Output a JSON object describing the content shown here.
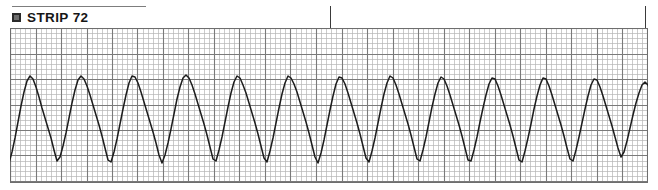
{
  "strip": {
    "bullet_icon": "filled-square-bullet-icon",
    "label": "STRIP 72",
    "rule_visible": true
  },
  "grid": {
    "small_square_px": 5.1,
    "bold_every_n_small": 5,
    "fine_line_color": "#b4b4b4",
    "bold_line_color": "#7a7a7a",
    "border_color": "#6e6e6e",
    "background": "#ffffff",
    "origin_x": 10,
    "origin_y": 28,
    "width": 638,
    "height": 155
  },
  "ticks": [
    {
      "name": "event-tick-1",
      "x": 330,
      "y_top": 6,
      "height": 22,
      "color": "#3a3a3a"
    },
    {
      "name": "event-tick-2",
      "x": 645,
      "y_top": 6,
      "height": 22,
      "color": "#3a3a3a"
    }
  ],
  "trace": {
    "name": "ecg-waveform-trace",
    "color": "#1c1c1c",
    "stroke_width": 1.5,
    "rhythm": "wide-complex tachycardia",
    "complex_count": 26,
    "cycle_px": 31.8,
    "first_peak_x": 30,
    "baseline_y": 120,
    "peak_y": 75,
    "trough_y": 163
  },
  "chart_data": {
    "type": "line",
    "title": "STRIP 72",
    "xlabel": "",
    "ylabel": "",
    "grid": true,
    "legend": "none",
    "series": [
      {
        "name": "ECG lead",
        "points": [
          [
            0,
            131
          ],
          [
            3,
            142
          ],
          [
            6,
            155
          ],
          [
            9,
            163
          ],
          [
            12,
            152
          ],
          [
            15,
            138
          ],
          [
            18,
            122
          ],
          [
            21,
            106
          ],
          [
            24,
            92
          ],
          [
            27,
            81
          ],
          [
            30,
            76
          ],
          [
            33,
            79
          ],
          [
            36,
            87
          ],
          [
            39,
            97
          ],
          [
            42,
            108
          ],
          [
            45,
            118
          ],
          [
            48,
            128
          ],
          [
            51,
            138
          ],
          [
            54,
            150
          ],
          [
            57,
            161
          ],
          [
            60,
            157
          ],
          [
            63,
            146
          ],
          [
            66,
            133
          ],
          [
            69,
            118
          ],
          [
            72,
            103
          ],
          [
            75,
            90
          ],
          [
            78,
            80
          ],
          [
            81,
            76
          ],
          [
            84,
            79
          ],
          [
            87,
            86
          ],
          [
            90,
            95
          ],
          [
            93,
            105
          ],
          [
            96,
            115
          ],
          [
            99,
            125
          ],
          [
            102,
            136
          ],
          [
            105,
            148
          ],
          [
            108,
            160
          ],
          [
            111,
            162
          ],
          [
            114,
            152
          ],
          [
            117,
            139
          ],
          [
            120,
            124
          ],
          [
            123,
            109
          ],
          [
            126,
            95
          ],
          [
            129,
            83
          ],
          [
            132,
            76
          ],
          [
            135,
            77
          ],
          [
            138,
            83
          ],
          [
            141,
            92
          ],
          [
            144,
            102
          ],
          [
            147,
            112
          ],
          [
            150,
            122
          ],
          [
            153,
            132
          ],
          [
            156,
            143
          ],
          [
            159,
            155
          ],
          [
            162,
            163
          ],
          [
            165,
            155
          ],
          [
            168,
            143
          ],
          [
            171,
            129
          ],
          [
            174,
            114
          ],
          [
            177,
            99
          ],
          [
            180,
            87
          ],
          [
            183,
            78
          ],
          [
            186,
            75
          ],
          [
            189,
            78
          ],
          [
            192,
            85
          ],
          [
            195,
            94
          ],
          [
            198,
            104
          ],
          [
            201,
            114
          ],
          [
            204,
            124
          ],
          [
            207,
            135
          ],
          [
            210,
            147
          ],
          [
            213,
            159
          ],
          [
            216,
            161
          ],
          [
            219,
            150
          ],
          [
            222,
            137
          ],
          [
            225,
            122
          ],
          [
            228,
            107
          ],
          [
            231,
            93
          ],
          [
            234,
            82
          ],
          [
            237,
            76
          ],
          [
            240,
            78
          ],
          [
            243,
            85
          ],
          [
            246,
            93
          ],
          [
            249,
            103
          ],
          [
            252,
            113
          ],
          [
            255,
            123
          ],
          [
            258,
            134
          ],
          [
            261,
            146
          ],
          [
            264,
            158
          ],
          [
            267,
            162
          ],
          [
            270,
            151
          ],
          [
            273,
            138
          ],
          [
            276,
            123
          ],
          [
            279,
            108
          ],
          [
            282,
            94
          ],
          [
            285,
            83
          ],
          [
            288,
            76
          ],
          [
            291,
            78
          ],
          [
            294,
            84
          ],
          [
            297,
            92
          ],
          [
            300,
            102
          ],
          [
            303,
            112
          ],
          [
            306,
            122
          ],
          [
            309,
            133
          ],
          [
            312,
            145
          ],
          [
            315,
            157
          ],
          [
            318,
            163
          ],
          [
            321,
            153
          ],
          [
            324,
            140
          ],
          [
            327,
            125
          ],
          [
            330,
            110
          ],
          [
            333,
            96
          ],
          [
            336,
            84
          ],
          [
            339,
            77
          ],
          [
            342,
            78
          ],
          [
            345,
            84
          ],
          [
            348,
            93
          ],
          [
            351,
            103
          ],
          [
            354,
            113
          ],
          [
            357,
            123
          ],
          [
            360,
            134
          ],
          [
            363,
            146
          ],
          [
            366,
            158
          ],
          [
            369,
            162
          ],
          [
            372,
            151
          ],
          [
            375,
            138
          ],
          [
            378,
            123
          ],
          [
            381,
            108
          ],
          [
            384,
            94
          ],
          [
            387,
            83
          ],
          [
            390,
            76
          ],
          [
            393,
            78
          ],
          [
            396,
            85
          ],
          [
            399,
            94
          ],
          [
            402,
            104
          ],
          [
            405,
            114
          ],
          [
            408,
            124
          ],
          [
            411,
            135
          ],
          [
            414,
            147
          ],
          [
            417,
            159
          ],
          [
            420,
            161
          ],
          [
            423,
            150
          ],
          [
            426,
            137
          ],
          [
            429,
            122
          ],
          [
            432,
            107
          ],
          [
            435,
            94
          ],
          [
            438,
            83
          ],
          [
            441,
            77
          ],
          [
            444,
            79
          ],
          [
            447,
            86
          ],
          [
            450,
            95
          ],
          [
            453,
            105
          ],
          [
            456,
            115
          ],
          [
            459,
            125
          ],
          [
            462,
            136
          ],
          [
            465,
            148
          ],
          [
            468,
            160
          ],
          [
            471,
            161
          ],
          [
            474,
            150
          ],
          [
            477,
            137
          ],
          [
            480,
            122
          ],
          [
            483,
            108
          ],
          [
            486,
            95
          ],
          [
            489,
            84
          ],
          [
            492,
            78
          ],
          [
            495,
            79
          ],
          [
            498,
            86
          ],
          [
            501,
            95
          ],
          [
            504,
            105
          ],
          [
            507,
            115
          ],
          [
            510,
            125
          ],
          [
            513,
            136
          ],
          [
            516,
            148
          ],
          [
            519,
            160
          ],
          [
            522,
            162
          ],
          [
            525,
            151
          ],
          [
            528,
            138
          ],
          [
            531,
            124
          ],
          [
            534,
            109
          ],
          [
            537,
            96
          ],
          [
            540,
            85
          ],
          [
            543,
            78
          ],
          [
            546,
            79
          ],
          [
            549,
            86
          ],
          [
            552,
            95
          ],
          [
            555,
            105
          ],
          [
            558,
            115
          ],
          [
            561,
            125
          ],
          [
            564,
            136
          ],
          [
            567,
            148
          ],
          [
            570,
            159
          ],
          [
            573,
            161
          ],
          [
            576,
            150
          ],
          [
            579,
            137
          ],
          [
            582,
            123
          ],
          [
            585,
            109
          ],
          [
            588,
            96
          ],
          [
            591,
            85
          ],
          [
            594,
            79
          ],
          [
            597,
            80
          ],
          [
            600,
            87
          ],
          [
            603,
            96
          ],
          [
            606,
            106
          ],
          [
            609,
            116
          ],
          [
            612,
            126
          ],
          [
            615,
            137
          ],
          [
            618,
            148
          ],
          [
            621,
            157
          ],
          [
            624,
            152
          ],
          [
            627,
            141
          ],
          [
            630,
            128
          ],
          [
            633,
            115
          ],
          [
            636,
            103
          ],
          [
            639,
            93
          ],
          [
            642,
            85
          ],
          [
            645,
            82
          ],
          [
            648,
            85
          ],
          [
            651,
            92
          ],
          [
            654,
            101
          ],
          [
            657,
            110
          ]
        ],
        "x_unit_px": true,
        "y_unit_px": true,
        "y_inverted": true
      }
    ],
    "xlim": [
      0,
      658
    ],
    "ylim": [
      183,
      28
    ]
  }
}
